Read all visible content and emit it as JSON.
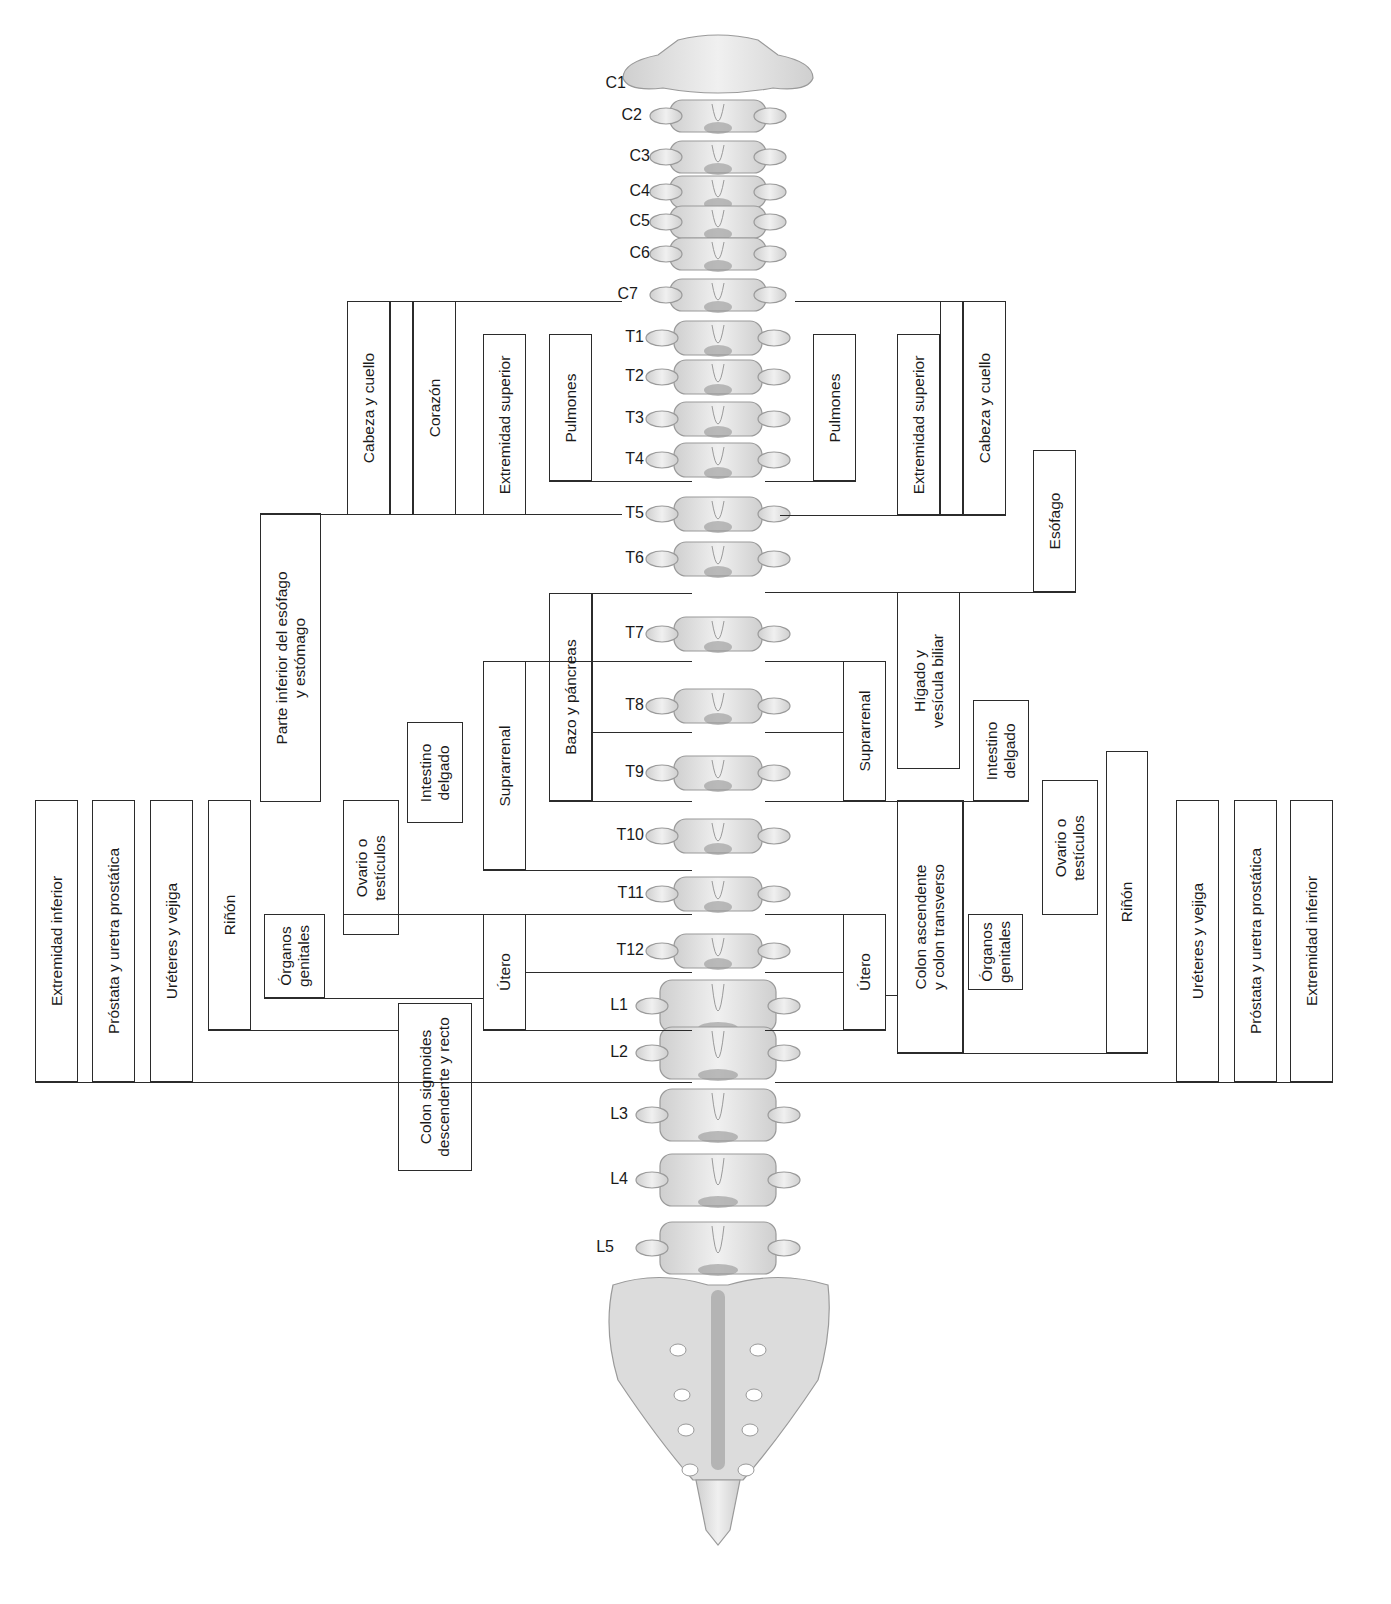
{
  "diagram": {
    "vertebrae": [
      {
        "id": "C1",
        "label": "C1",
        "x": 596,
        "y": 84
      },
      {
        "id": "C2",
        "label": "C2",
        "x": 612,
        "y": 116
      },
      {
        "id": "C3",
        "label": "C3",
        "x": 620,
        "y": 157
      },
      {
        "id": "C4",
        "label": "C4",
        "x": 620,
        "y": 192
      },
      {
        "id": "C5",
        "label": "C5",
        "x": 620,
        "y": 222
      },
      {
        "id": "C6",
        "label": "C6",
        "x": 620,
        "y": 254
      },
      {
        "id": "C7",
        "label": "C7",
        "x": 608,
        "y": 295
      },
      {
        "id": "T1",
        "label": "T1",
        "x": 614,
        "y": 338
      },
      {
        "id": "T2",
        "label": "T2",
        "x": 614,
        "y": 377
      },
      {
        "id": "T3",
        "label": "T3",
        "x": 614,
        "y": 419
      },
      {
        "id": "T4",
        "label": "T4",
        "x": 614,
        "y": 460
      },
      {
        "id": "T5",
        "label": "T5",
        "x": 614,
        "y": 514
      },
      {
        "id": "T6",
        "label": "T6",
        "x": 614,
        "y": 559
      },
      {
        "id": "T7",
        "label": "T7",
        "x": 614,
        "y": 634
      },
      {
        "id": "T8",
        "label": "T8",
        "x": 614,
        "y": 706
      },
      {
        "id": "T9",
        "label": "T9",
        "x": 614,
        "y": 773
      },
      {
        "id": "T10",
        "label": "T10",
        "x": 614,
        "y": 836
      },
      {
        "id": "T11",
        "label": "T11",
        "x": 614,
        "y": 894
      },
      {
        "id": "T12",
        "label": "T12",
        "x": 614,
        "y": 951
      },
      {
        "id": "L1",
        "label": "L1",
        "x": 598,
        "y": 1006
      },
      {
        "id": "L2",
        "label": "L2",
        "x": 598,
        "y": 1053
      },
      {
        "id": "L3",
        "label": "L3",
        "x": 598,
        "y": 1115
      },
      {
        "id": "L4",
        "label": "L4",
        "x": 598,
        "y": 1180
      },
      {
        "id": "L5",
        "label": "L5",
        "x": 584,
        "y": 1248
      }
    ],
    "left_boxes": [
      {
        "id": "L-cabeza",
        "label": "Cabeza y cuello",
        "x": 347,
        "y": 301,
        "w": 43,
        "h": 214
      },
      {
        "id": "L-blank1",
        "label": "",
        "x": 390,
        "y": 301,
        "w": 23,
        "h": 214
      },
      {
        "id": "L-corazon",
        "label": "Corazón",
        "x": 413,
        "y": 301,
        "w": 43,
        "h": 214
      },
      {
        "id": "L-ext-sup",
        "label": "Extremidad superior",
        "x": 483,
        "y": 334,
        "w": 43,
        "h": 181
      },
      {
        "id": "L-pulmones",
        "label": "Pulmones",
        "x": 549,
        "y": 334,
        "w": 43,
        "h": 147
      },
      {
        "id": "L-esofago-est",
        "label": "Parte inferior del esófago\ny estómago",
        "x": 260,
        "y": 513,
        "w": 61,
        "h": 289
      },
      {
        "id": "L-bazo",
        "label": "Bazo y páncreas",
        "x": 549,
        "y": 593,
        "w": 43,
        "h": 208
      },
      {
        "id": "L-suprarrenal",
        "label": "Suprarrenal",
        "x": 483,
        "y": 661,
        "w": 43,
        "h": 209
      },
      {
        "id": "L-intestino",
        "label": "Intestino\ndelgado",
        "x": 407,
        "y": 722,
        "w": 56,
        "h": 101
      },
      {
        "id": "L-ovario",
        "label": "Ovario o\ntestículos",
        "x": 343,
        "y": 800,
        "w": 56,
        "h": 135
      },
      {
        "id": "L-organos",
        "label": "Órganos\ngenitales",
        "x": 264,
        "y": 914,
        "w": 61,
        "h": 84
      },
      {
        "id": "L-utero",
        "label": "Útero",
        "x": 483,
        "y": 914,
        "w": 43,
        "h": 116
      },
      {
        "id": "L-rinon",
        "label": "Riñón",
        "x": 208,
        "y": 800,
        "w": 43,
        "h": 230
      },
      {
        "id": "L-ureteres",
        "label": "Uréteres y vejiga",
        "x": 150,
        "y": 800,
        "w": 43,
        "h": 282
      },
      {
        "id": "L-prostata",
        "label": "Próstata y uretra prostática",
        "x": 92,
        "y": 800,
        "w": 43,
        "h": 282
      },
      {
        "id": "L-ext-inf",
        "label": "Extremidad inferior",
        "x": 35,
        "y": 800,
        "w": 43,
        "h": 282
      },
      {
        "id": "L-colon-sig",
        "label": "Colon sigmoides\ndescendente y recto",
        "x": 398,
        "y": 1003,
        "w": 74,
        "h": 168
      }
    ],
    "right_boxes": [
      {
        "id": "R-pulmones",
        "label": "Pulmones",
        "x": 813,
        "y": 334,
        "w": 43,
        "h": 147
      },
      {
        "id": "R-ext-sup",
        "label": "Extremidad superior",
        "x": 897,
        "y": 334,
        "w": 43,
        "h": 181
      },
      {
        "id": "R-blank",
        "label": "",
        "x": 940,
        "y": 301,
        "w": 23,
        "h": 214
      },
      {
        "id": "R-cabeza",
        "label": "Cabeza y cuello",
        "x": 963,
        "y": 301,
        "w": 43,
        "h": 214
      },
      {
        "id": "R-esofago",
        "label": "Esófago",
        "x": 1033,
        "y": 450,
        "w": 43,
        "h": 142
      },
      {
        "id": "R-higado",
        "label": "Hígado y\nvesícula biliar",
        "x": 897,
        "y": 592,
        "w": 63,
        "h": 177
      },
      {
        "id": "R-suprarrenal",
        "label": "Suprarrenal",
        "x": 843,
        "y": 661,
        "w": 43,
        "h": 140
      },
      {
        "id": "R-intestino",
        "label": "Intestino\ndelgado",
        "x": 973,
        "y": 700,
        "w": 56,
        "h": 101
      },
      {
        "id": "R-ovario",
        "label": "Ovario o\ntestículos",
        "x": 1042,
        "y": 780,
        "w": 56,
        "h": 135
      },
      {
        "id": "R-colon-asc",
        "label": "Colon ascendente\ny colon transverso",
        "x": 897,
        "y": 800,
        "w": 66,
        "h": 253
      },
      {
        "id": "R-organos",
        "label": "Órganos\ngenitales",
        "x": 968,
        "y": 914,
        "w": 55,
        "h": 76
      },
      {
        "id": "R-utero",
        "label": "Útero",
        "x": 843,
        "y": 914,
        "w": 43,
        "h": 116
      },
      {
        "id": "R-rinon",
        "label": "Riñón",
        "x": 1106,
        "y": 751,
        "w": 42,
        "h": 302
      },
      {
        "id": "R-ureteres",
        "label": "Uréteres y vejiga",
        "x": 1176,
        "y": 800,
        "w": 43,
        "h": 282
      },
      {
        "id": "R-prostata",
        "label": "Próstata y uretra prostática",
        "x": 1234,
        "y": 800,
        "w": 43,
        "h": 282
      },
      {
        "id": "R-ext-inf",
        "label": "Extremidad inferior",
        "x": 1290,
        "y": 800,
        "w": 43,
        "h": 282
      }
    ],
    "hlines": [
      {
        "x1": 347,
        "x2": 622,
        "y": 301
      },
      {
        "x1": 260,
        "x2": 622,
        "y": 514
      },
      {
        "x1": 549,
        "x2": 692,
        "y": 481
      },
      {
        "x1": 549,
        "x2": 692,
        "y": 593
      },
      {
        "x1": 483,
        "x2": 692,
        "y": 661
      },
      {
        "x1": 592,
        "x2": 692,
        "y": 732
      },
      {
        "x1": 549,
        "x2": 692,
        "y": 801
      },
      {
        "x1": 483,
        "x2": 692,
        "y": 870
      },
      {
        "x1": 343,
        "x2": 692,
        "y": 914
      },
      {
        "x1": 526,
        "x2": 692,
        "y": 972
      },
      {
        "x1": 264,
        "x2": 483,
        "y": 998
      },
      {
        "x1": 208,
        "x2": 398,
        "y": 1030
      },
      {
        "x1": 483,
        "x2": 692,
        "y": 1030
      },
      {
        "x1": 35,
        "x2": 692,
        "y": 1082
      },
      {
        "x1": 795,
        "x2": 1006,
        "y": 301
      },
      {
        "x1": 765,
        "x2": 856,
        "y": 481
      },
      {
        "x1": 780,
        "x2": 1006,
        "y": 515
      },
      {
        "x1": 765,
        "x2": 1076,
        "y": 592
      },
      {
        "x1": 765,
        "x2": 886,
        "y": 661
      },
      {
        "x1": 765,
        "x2": 843,
        "y": 732
      },
      {
        "x1": 765,
        "x2": 1029,
        "y": 801
      },
      {
        "x1": 765,
        "x2": 886,
        "y": 914
      },
      {
        "x1": 765,
        "x2": 843,
        "y": 972
      },
      {
        "x1": 886,
        "x2": 897,
        "y": 995
      },
      {
        "x1": 765,
        "x2": 886,
        "y": 1030
      },
      {
        "x1": 897,
        "x2": 1148,
        "y": 1053
      },
      {
        "x1": 775,
        "x2": 1333,
        "y": 1082
      }
    ],
    "vlines": [
      {
        "x": 592,
        "y1": 593,
        "y2": 801
      },
      {
        "x": 963,
        "y1": 800,
        "y2": 1053
      }
    ],
    "colors": {
      "line": "#2b2b2b",
      "bone_fill": "#e6e6e6",
      "bone_stroke": "#9a9a9a",
      "disc": "#8c8c8c",
      "background": "#ffffff"
    }
  }
}
